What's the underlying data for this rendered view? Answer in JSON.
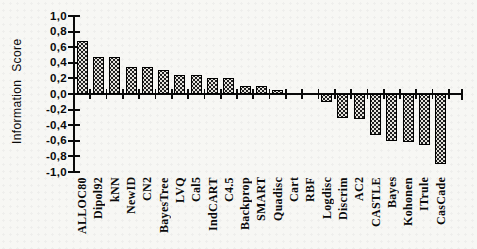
{
  "chart_data": {
    "type": "bar",
    "title": "",
    "xlabel": "",
    "ylabel": "Information Score",
    "categories": [
      "ALLOC80",
      "Dipol92",
      "kNN",
      "NewID",
      "CN2",
      "BayesTree",
      "LVQ",
      "Cal5",
      "IndCART",
      "C4.5",
      "Backprop",
      "SMART",
      "Quadisc",
      "Cart",
      "RBF",
      "Logdisc",
      "Discrim",
      "AC2",
      "CASTLE",
      "Bayes",
      "Kohonen",
      "ITrule",
      "CasCade"
    ],
    "values": [
      0.68,
      0.48,
      0.48,
      0.35,
      0.35,
      0.31,
      0.25,
      0.25,
      0.2,
      0.2,
      0.1,
      0.1,
      0.05,
      0.01,
      0.0,
      -0.1,
      -0.31,
      -0.32,
      -0.52,
      -0.6,
      -0.62,
      -0.65,
      -0.9
    ],
    "ylim": [
      -1.0,
      1.0
    ],
    "y_tick_values": [
      1.0,
      0.8,
      0.6,
      0.4,
      0.2,
      0.0,
      -0.2,
      -0.4,
      -0.6,
      -0.8,
      -1.0
    ],
    "y_tick_labels": [
      "1,0",
      "0,8",
      "0,6",
      "0,4",
      "0,2",
      "0,0",
      "-0,2",
      "-0,4",
      "-0,6",
      "-0,8",
      "-1,0"
    ],
    "decimal_separator": ",",
    "grid": false,
    "legend": false,
    "bar_texture": "dark-stippled",
    "colors": {
      "background": "#f7f7f4",
      "bar_fill": "#1f1f1f",
      "bar_speckle": "#e6e4de",
      "axis": "#0a0a0a",
      "text": "#0a0a0a"
    }
  }
}
